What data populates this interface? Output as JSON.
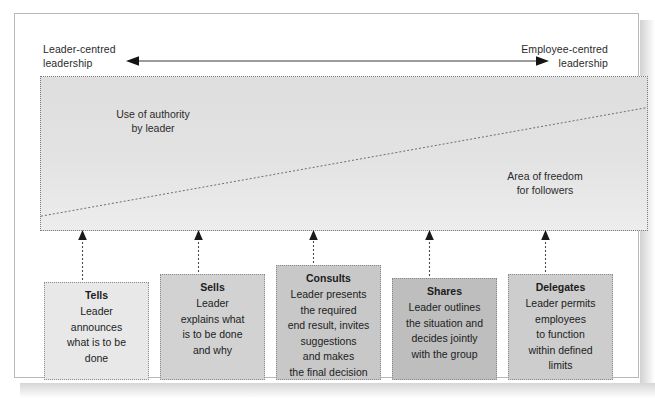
{
  "diagram": {
    "axis": {
      "left_label": "Leader-centred\nleadership",
      "right_label": "Employee-centred\nleadership",
      "arrow_name": "double-headed-arrow"
    },
    "band": {
      "left_text": "Use of authority\nby leader",
      "right_text": "Area of freedom\nfor followers",
      "fill_top": "#dedede",
      "fill_bottom": "#ededed",
      "border_style": "dotted"
    },
    "styles": {
      "box_fill_1": "#e8e8e8",
      "box_fill_2": "#d2d2d2",
      "box_fill_3": "#c8c8c8",
      "box_fill_4": "#bebebe",
      "box_fill_5": "#cdcdcd",
      "frame_border": "#b9b9b9",
      "text_color": "#1c1c1c"
    },
    "options": [
      {
        "title": "Tells",
        "body": "Leader\nannounces\nwhat is to be\ndone"
      },
      {
        "title": "Sells",
        "body": "Leader\nexplains what\nis to be done\nand why"
      },
      {
        "title": "Consults",
        "body": "Leader presents\nthe required\nend result, invites\nsuggestions\nand makes\nthe final decision"
      },
      {
        "title": "Shares",
        "body": "Leader outlines\nthe situation and\ndecides jointly\nwith the group"
      },
      {
        "title": "Delegates",
        "body": "Leader permits\nemployees\nto function\nwithin defined\nlimits"
      }
    ]
  }
}
